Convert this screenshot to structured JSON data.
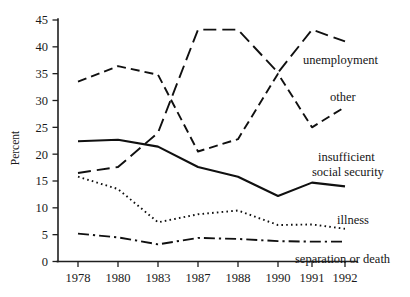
{
  "chart_data": {
    "type": "line",
    "title": "",
    "subtitle": "",
    "xlabel": "",
    "ylabel": "Percent",
    "categories": [
      "1978",
      "1980",
      "1983",
      "1987",
      "1988",
      "1990",
      "1991",
      "1992"
    ],
    "x": [
      1978,
      1980,
      1983,
      1987,
      1988,
      1990,
      1991,
      1992
    ],
    "ylim": [
      0,
      45
    ],
    "yticks": [
      0,
      5,
      10,
      15,
      20,
      25,
      30,
      35,
      40,
      45
    ],
    "ytick_labels": [
      "0",
      "5",
      "10",
      "15",
      "20",
      "25",
      "30",
      "35",
      "40",
      "45"
    ],
    "grid": false,
    "legend_position": "inline-right-labels",
    "series": [
      {
        "name": "unemployment",
        "style": "long-dash",
        "values": [
          16.5,
          17.6,
          24.0,
          43.2,
          43.2,
          35.2,
          43.2,
          41.0
        ]
      },
      {
        "name": "other",
        "style": "dash",
        "values": [
          33.5,
          36.4,
          34.8,
          20.5,
          22.8,
          35.0,
          25.0,
          28.8
        ]
      },
      {
        "name": "insufficient social security",
        "style": "solid",
        "values": [
          22.4,
          22.7,
          21.4,
          17.6,
          15.8,
          12.2,
          14.7,
          14.0
        ]
      },
      {
        "name": "illness",
        "style": "dotted",
        "values": [
          15.8,
          13.5,
          7.3,
          8.8,
          9.5,
          6.8,
          6.9,
          6.1
        ]
      },
      {
        "name": "separation or death",
        "style": "dash-dot",
        "values": [
          5.2,
          4.5,
          3.2,
          4.4,
          4.2,
          3.8,
          3.7,
          3.7
        ]
      }
    ],
    "annotations": [
      {
        "text": "unemployment",
        "series": "unemployment"
      },
      {
        "text": "other",
        "series": "other"
      },
      {
        "text": "insufficient",
        "series": "insufficient social security"
      },
      {
        "text": "social security",
        "series": "insufficient social security"
      },
      {
        "text": "illness",
        "series": "illness"
      },
      {
        "text": "separation or death",
        "series": "separation or death"
      }
    ],
    "colors": {
      "axis": "#1f1f1f",
      "line": "#101010",
      "background": "#ffffff"
    }
  }
}
